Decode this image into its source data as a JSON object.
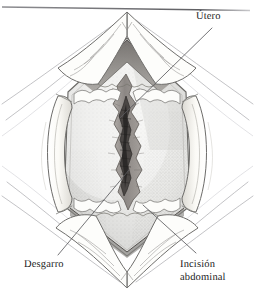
{
  "figure": {
    "kind": "medical-illustration",
    "style": "grayscale pen-and-ink with stipple shading",
    "background_color": "#ffffff"
  },
  "labels": {
    "utero": "Útero",
    "desgarro": "Desgarro",
    "incision_line1": "Incisión",
    "incision_line2": "abdominal"
  },
  "palette": {
    "ink": "#3c3c40",
    "ink_soft": "#8a8a90",
    "ink_faint": "#b8b8bd",
    "uterus_body": "#e9e9e7",
    "uterus_body_dark": "#d5d5d4",
    "uterus_rim": "#9d9c99",
    "wedge_dark": "#787471",
    "retractor": "#fbfaf7",
    "retractor_shade": "#e2e0db",
    "drape": "#fdfdfc",
    "tear_outer": "#9a9591",
    "tear_inner": "#524e4c",
    "tear_core": "#2e2b2a",
    "rule": "#6e6e72",
    "label_text": "#1a1a1a"
  },
  "leader_lines": [
    {
      "name": "utero-leader",
      "label": "Útero",
      "from_x": 212,
      "from_y": 28,
      "to_x": 120,
      "to_y": 118
    },
    {
      "name": "desgarro-leader",
      "label": "Desgarro",
      "from_x": 58,
      "from_y": 255,
      "to_x": 129,
      "to_y": 170
    },
    {
      "name": "incision-leader",
      "label": "Incisión abdominal",
      "from_x": 196,
      "from_y": 253,
      "to_x": 143,
      "to_y": 205
    }
  ],
  "regions": [
    {
      "name": "uterus-body",
      "description": "hexagonal lens-shaped uterine surface with fine stipple"
    },
    {
      "name": "uterine-tear",
      "description": "vertical jagged spindle-shaped laceration at center"
    },
    {
      "name": "retractor-left",
      "description": "curved pale retractor blade on left margin"
    },
    {
      "name": "retractor-right",
      "description": "curved pale retractor blade on right margin"
    },
    {
      "name": "apex-top",
      "description": "V-shaped superior apex with retracted tissue flaps"
    },
    {
      "name": "apex-bottom",
      "description": "inverted V inferior apex with draped tissue"
    },
    {
      "name": "drape-folds",
      "description": "radiating thin contour lines of surgical drape"
    },
    {
      "name": "top-rule",
      "description": "thin horizontal rule across upper edge of plate"
    }
  ]
}
